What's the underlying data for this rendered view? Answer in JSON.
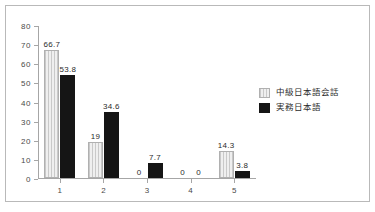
{
  "chart_data": {
    "type": "bar",
    "title": "",
    "xlabel": "",
    "ylabel": "",
    "ylim": [
      0,
      80
    ],
    "ytick_step": 10,
    "yticks": [
      "0",
      "10",
      "20",
      "30",
      "40",
      "50",
      "60",
      "70",
      "80"
    ],
    "categories": [
      "1",
      "2",
      "3",
      "4",
      "5"
    ],
    "grid": false,
    "legend_position": "right",
    "series": [
      {
        "name": "中級日本語会話",
        "values": [
          66.7,
          19,
          0,
          0,
          14.3
        ],
        "labels": [
          "66.7",
          "19",
          "0",
          "0",
          "14.3"
        ],
        "color": "#e8e8e8",
        "pattern": "vertical-stripes"
      },
      {
        "name": "実務日本語",
        "values": [
          53.8,
          34.6,
          7.7,
          0,
          3.8
        ],
        "labels": [
          "53.8",
          "34.6",
          "7.7",
          "0",
          "3.8"
        ],
        "color": "#151515",
        "pattern": "solid"
      }
    ]
  },
  "frame": {
    "border_color": "#b9b9b9",
    "axis_color": "#a6a6a6"
  }
}
